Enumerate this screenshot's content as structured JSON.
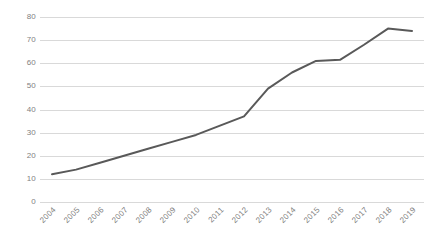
{
  "chart_data": {
    "type": "line",
    "title": "",
    "subtitle": "",
    "xlabel": "",
    "ylabel": "",
    "categories": [
      "2004",
      "2005",
      "2006",
      "2007",
      "2008",
      "2009",
      "2010",
      "2011",
      "2012",
      "2013",
      "2014",
      "2015",
      "2016",
      "2017",
      "2018",
      "2019"
    ],
    "values": [
      12,
      14,
      17,
      20,
      23,
      26,
      29,
      33,
      37,
      49,
      56,
      61,
      61.5,
      68,
      75,
      74
    ],
    "series": [
      {
        "name": "",
        "values": [
          12,
          14,
          17,
          20,
          23,
          26,
          29,
          33,
          37,
          49,
          56,
          61,
          61.5,
          68,
          75,
          74
        ],
        "color": "#595959"
      }
    ],
    "ylim": [
      0,
      80
    ],
    "ytick_values": [
      0,
      10,
      20,
      30,
      40,
      50,
      60,
      70,
      80
    ],
    "ytick_labels": [
      "0",
      "10",
      "20",
      "30",
      "40",
      "50",
      "60",
      "70",
      "80"
    ],
    "xtick_labels": [
      "2004",
      "2005",
      "2006",
      "2007",
      "2008",
      "2009",
      "2010",
      "2011",
      "2012",
      "2013",
      "2014",
      "2015",
      "2016",
      "2017",
      "2018",
      "2019"
    ],
    "grid": true,
    "grid_axis": "y",
    "legend": false,
    "legend_position": "none",
    "markers": false,
    "annotations": [],
    "colors": {
      "line": "#595959",
      "gridline": "#d9d9d9",
      "tick_label": "#7f7f7f",
      "background": "#ffffff"
    }
  }
}
